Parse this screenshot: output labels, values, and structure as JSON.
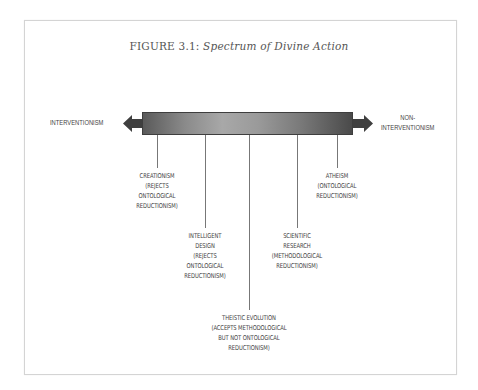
{
  "figure": {
    "title_prefix": "FIGURE 3.1:",
    "title_italic": "Spectrum of Divine Action"
  },
  "axis": {
    "left_end": "INTERVENTIONISM",
    "right_end_line1": "NON-",
    "right_end_line2": "INTERVENTIONISM"
  },
  "positions": [
    {
      "name": "Creationism",
      "lines": [
        "CREATIONISM",
        "(REJECTS",
        "ONTOLOGICAL",
        "REDUCTIONISM)"
      ]
    },
    {
      "name": "Intelligent Design",
      "lines": [
        "INTELLIGENT",
        "DESIGN",
        "(REJECTS",
        "ONTOLOGICAL",
        "REDUCTIONISM)"
      ]
    },
    {
      "name": "Theistic Evolution",
      "lines": [
        "THEISTIC EVOLUTION",
        "(ACCEPTS METHODOLOGICAL",
        "BUT NOT ONTOLOGICAL",
        "REDUCTIONISM)"
      ]
    },
    {
      "name": "Scientific Research",
      "lines": [
        "SCIENTIFIC",
        "RESEARCH",
        "(METHODOLOGICAL",
        "REDUCTIONISM)"
      ]
    },
    {
      "name": "Atheism",
      "lines": [
        "ATHEISM",
        "(ONTOLOGICAL",
        "REDUCTIONISM)"
      ]
    }
  ],
  "colors": {
    "bar_dark": "#4a4a4a",
    "bar_light": "#a8a8a8",
    "text": "#444444",
    "frame": "#d4d4d4"
  }
}
